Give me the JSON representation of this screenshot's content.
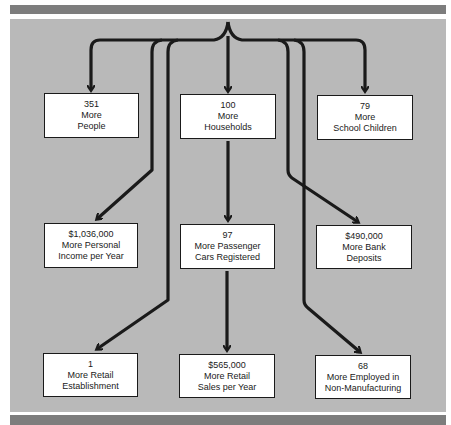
{
  "diagram": {
    "type": "flow",
    "colors": {
      "bar": "#7d7d7d",
      "panel": "#b9b9b9",
      "box": "#ffffff",
      "line": "#1a1a1a"
    },
    "boxes": [
      {
        "id": "people",
        "lines": [
          "351",
          "More",
          "People"
        ]
      },
      {
        "id": "households",
        "lines": [
          "100",
          "More",
          "Households"
        ]
      },
      {
        "id": "school",
        "lines": [
          "79",
          "More",
          "School Children"
        ]
      },
      {
        "id": "income",
        "lines": [
          "$1,036,000",
          "More Personal",
          "Income per Year"
        ]
      },
      {
        "id": "cars",
        "lines": [
          "97",
          "More Passenger",
          "Cars Registered"
        ]
      },
      {
        "id": "deposits",
        "lines": [
          "$490,000",
          "More Bank",
          "Deposits"
        ]
      },
      {
        "id": "retail-est",
        "lines": [
          "1",
          "More Retail",
          "Establishment"
        ]
      },
      {
        "id": "retail-sales",
        "lines": [
          "$565,000",
          "More Retail",
          "Sales per Year"
        ]
      },
      {
        "id": "employed",
        "lines": [
          "68",
          "More Employed in",
          "Non-Manufacturing"
        ]
      }
    ],
    "edges": [
      [
        "source",
        "people"
      ],
      [
        "source",
        "households"
      ],
      [
        "source",
        "school"
      ],
      [
        "source",
        "income"
      ],
      [
        "households",
        "cars"
      ],
      [
        "source",
        "deposits"
      ],
      [
        "source",
        "retail-est"
      ],
      [
        "cars",
        "retail-sales"
      ],
      [
        "source",
        "employed"
      ]
    ]
  }
}
